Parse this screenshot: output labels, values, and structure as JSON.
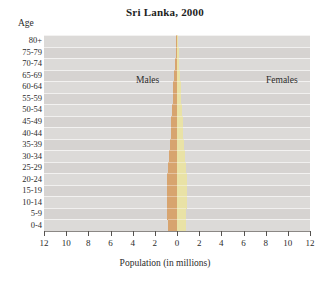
{
  "chart_data": {
    "type": "bar",
    "title": "Sri Lanka, 2000",
    "subtitle": "",
    "xlabel": "Population (in millions)",
    "ylabel": "Age",
    "xlim": [
      -12,
      12
    ],
    "xticks": [
      12,
      10,
      8,
      6,
      4,
      2,
      0,
      2,
      4,
      6,
      8,
      10,
      12
    ],
    "xtick_values": [
      -12,
      -10,
      -8,
      -6,
      -4,
      -2,
      0,
      2,
      4,
      6,
      8,
      10,
      12
    ],
    "grid": true,
    "legend_position": "in-plot",
    "orientation": "population-pyramid",
    "categories": [
      "80+",
      "75-79",
      "70-74",
      "65-69",
      "60-64",
      "55-59",
      "50-54",
      "45-49",
      "40-44",
      "35-39",
      "30-34",
      "25-29",
      "20-24",
      "15-19",
      "10-14",
      "5-9",
      "0-4"
    ],
    "series": [
      {
        "name": "Males",
        "color": "#d7a46f",
        "side": "left",
        "values": [
          0.09,
          0.13,
          0.19,
          0.26,
          0.33,
          0.38,
          0.44,
          0.52,
          0.57,
          0.63,
          0.68,
          0.77,
          0.86,
          0.92,
          0.9,
          0.87,
          0.84
        ]
      },
      {
        "name": "Females",
        "color": "#e9e2a6",
        "side": "right",
        "values": [
          0.11,
          0.15,
          0.21,
          0.28,
          0.35,
          0.4,
          0.46,
          0.53,
          0.58,
          0.64,
          0.7,
          0.79,
          0.88,
          0.91,
          0.87,
          0.84,
          0.81
        ]
      }
    ]
  },
  "labels": {
    "males": "Males",
    "females": "Females"
  }
}
